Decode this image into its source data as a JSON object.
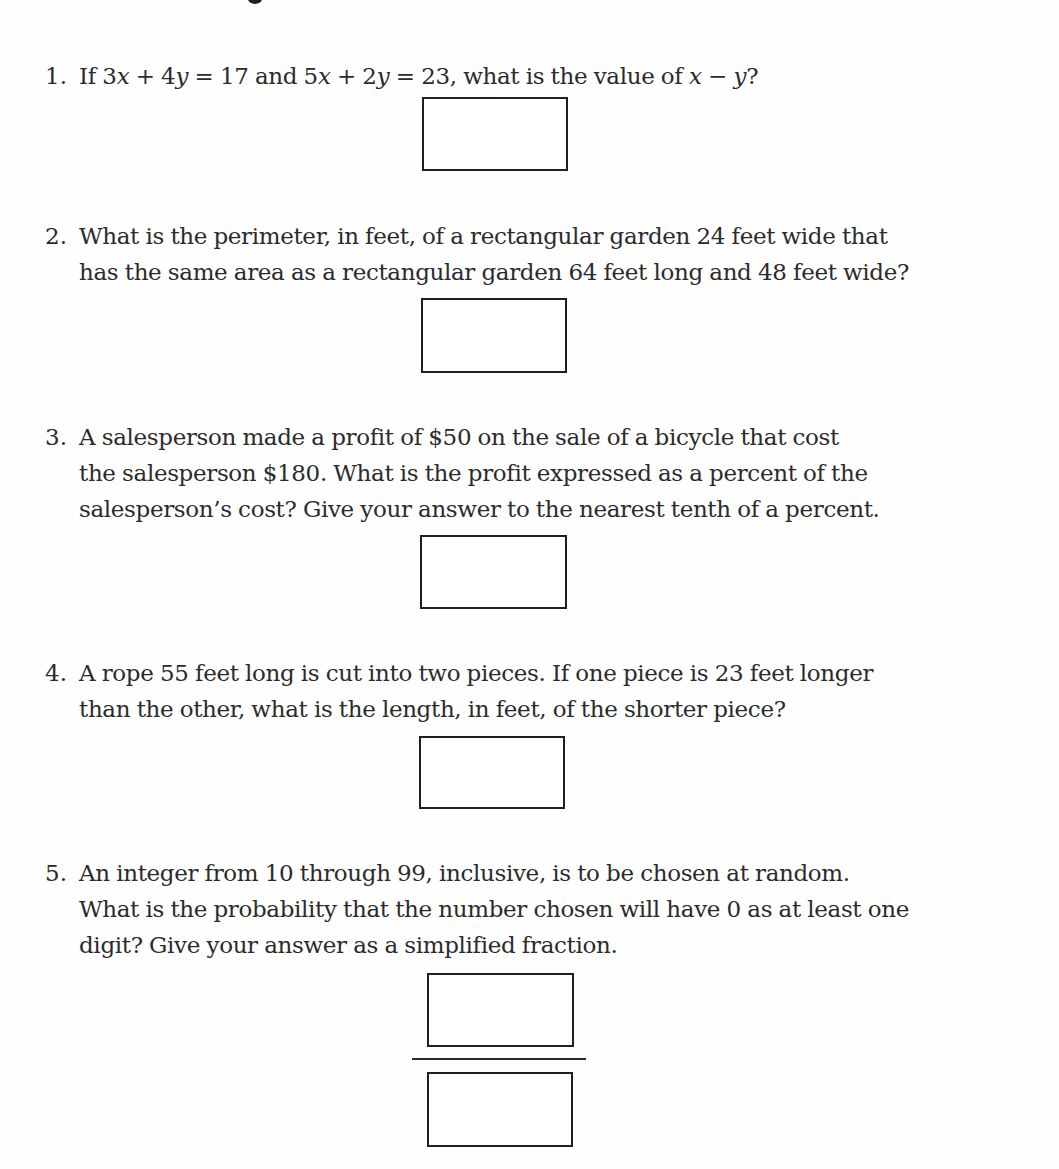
{
  "colors": {
    "text": "#2b2b2b",
    "box_border": "#1f1f1f",
    "background": "#fefefe"
  },
  "questions": [
    {
      "number": "1.",
      "lines": [
        [
          {
            "t": "If 3"
          },
          {
            "t": "x",
            "var": true
          },
          {
            "t": " + 4"
          },
          {
            "t": "y",
            "var": true
          },
          {
            "t": " = 17 and 5"
          },
          {
            "t": "x",
            "var": true
          },
          {
            "t": " + 2"
          },
          {
            "t": "y",
            "var": true
          },
          {
            "t": " = 23, what is the value of "
          },
          {
            "t": "x",
            "var": true
          },
          {
            "t": " − "
          },
          {
            "t": "y",
            "var": true
          },
          {
            "t": "?"
          }
        ]
      ],
      "answer_type": "single-box"
    },
    {
      "number": "2.",
      "lines": [
        [
          {
            "t": "What is the perimeter, in feet, of a rectangular garden 24 feet wide that"
          }
        ],
        [
          {
            "t": "has the same area as a rectangular garden 64 feet long and 48 feet wide?"
          }
        ]
      ],
      "answer_type": "single-box"
    },
    {
      "number": "3.",
      "lines": [
        [
          {
            "t": "A salesperson made a profit of $50 on the sale of a bicycle that cost"
          }
        ],
        [
          {
            "t": "the salesperson $180. What is the profit expressed as a percent of the"
          }
        ],
        [
          {
            "t": "salesperson’s cost? Give your answer to the nearest tenth of a percent."
          }
        ]
      ],
      "answer_type": "single-box"
    },
    {
      "number": "4.",
      "lines": [
        [
          {
            "t": "A rope 55 feet long is cut into two pieces. If one piece is 23 feet longer"
          }
        ],
        [
          {
            "t": "than the other, what is the length, in feet, of the shorter piece?"
          }
        ]
      ],
      "answer_type": "single-box"
    },
    {
      "number": "5.",
      "lines": [
        [
          {
            "t": "An integer from 10 through 99, inclusive, is to be chosen at random."
          }
        ],
        [
          {
            "t": "What is the probability that the number chosen will have 0 as at least one"
          }
        ],
        [
          {
            "t": "digit? Give your answer as a simplified fraction."
          }
        ]
      ],
      "answer_type": "fraction-boxes"
    }
  ],
  "answers": {
    "q1": "",
    "q2": "",
    "q3": "",
    "q4": "",
    "q5_numerator": "",
    "q5_denominator": ""
  }
}
